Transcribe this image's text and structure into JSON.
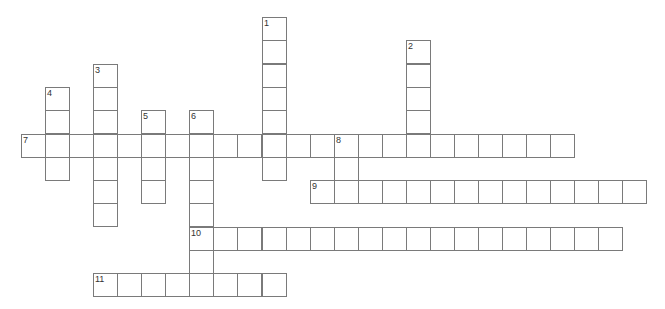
{
  "puzzle": {
    "colors": {
      "background": "#ffffff",
      "grid_line": "#7a7a7a",
      "number": "#333333"
    },
    "layout": {
      "origin_x": 21,
      "origin_y": 17,
      "cell_w": 24.05,
      "cell_h": 23.3
    },
    "entries": [
      {
        "number": "1",
        "direction": "down",
        "row": 0,
        "col": 10,
        "length": 7
      },
      {
        "number": "2",
        "direction": "down",
        "row": 1,
        "col": 16,
        "length": 5
      },
      {
        "number": "3",
        "direction": "down",
        "row": 2,
        "col": 3,
        "length": 7
      },
      {
        "number": "4",
        "direction": "down",
        "row": 3,
        "col": 1,
        "length": 4
      },
      {
        "number": "5",
        "direction": "down",
        "row": 4,
        "col": 5,
        "length": 4
      },
      {
        "number": "6",
        "direction": "down",
        "row": 4,
        "col": 7,
        "length": 8
      },
      {
        "number": "7",
        "direction": "across",
        "row": 5,
        "col": 0,
        "length": 23
      },
      {
        "number": "8",
        "direction": "down",
        "row": 5,
        "col": 13,
        "length": 3
      },
      {
        "number": "9",
        "direction": "across",
        "row": 7,
        "col": 12,
        "length": 14
      },
      {
        "number": "10",
        "direction": "across",
        "row": 9,
        "col": 7,
        "length": 18
      },
      {
        "number": "11",
        "direction": "across",
        "row": 11,
        "col": 3,
        "length": 8
      }
    ]
  }
}
